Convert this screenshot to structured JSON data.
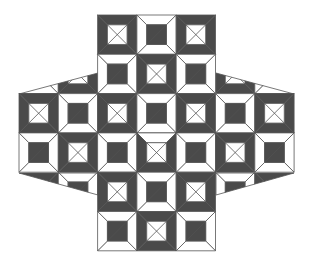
{
  "figure": {
    "width": 311,
    "height": 269,
    "origin_x": 19,
    "origin_y": 15,
    "tile_size": 39.3,
    "inner_ratio": 0.5,
    "colors": {
      "background": "#ffffff",
      "dark": "#4a4a4a",
      "light": "#ffffff",
      "line": "#555555"
    },
    "tile_types": {
      "A": "dark frame, white inner square with X",
      "B": "white frame, dark inner square",
      "X": "hybrid: light top bevel, dark side/bottom bevels, white inner square with X"
    },
    "tiles": [
      {
        "row": 0,
        "col": 2,
        "type": "A"
      },
      {
        "row": 0,
        "col": 3,
        "type": "B"
      },
      {
        "row": 0,
        "col": 4,
        "type": "A"
      },
      {
        "row": 1,
        "col": 2,
        "type": "B"
      },
      {
        "row": 1,
        "col": 3,
        "type": "A"
      },
      {
        "row": 1,
        "col": 4,
        "type": "B"
      },
      {
        "row": 2,
        "col": 0,
        "type": "A"
      },
      {
        "row": 2,
        "col": 1,
        "type": "B"
      },
      {
        "row": 2,
        "col": 2,
        "type": "A"
      },
      {
        "row": 2,
        "col": 3,
        "type": "B"
      },
      {
        "row": 2,
        "col": 4,
        "type": "A"
      },
      {
        "row": 2,
        "col": 5,
        "type": "B"
      },
      {
        "row": 2,
        "col": 6,
        "type": "A"
      },
      {
        "row": 3,
        "col": 0,
        "type": "B"
      },
      {
        "row": 3,
        "col": 1,
        "type": "A"
      },
      {
        "row": 3,
        "col": 2,
        "type": "B"
      },
      {
        "row": 3,
        "col": 3,
        "type": "X"
      },
      {
        "row": 3,
        "col": 4,
        "type": "B"
      },
      {
        "row": 3,
        "col": 5,
        "type": "A"
      },
      {
        "row": 3,
        "col": 6,
        "type": "B"
      },
      {
        "row": 4,
        "col": 2,
        "type": "A"
      },
      {
        "row": 4,
        "col": 3,
        "type": "B"
      },
      {
        "row": 4,
        "col": 4,
        "type": "A"
      },
      {
        "row": 5,
        "col": 2,
        "type": "B"
      },
      {
        "row": 5,
        "col": 3,
        "type": "A"
      },
      {
        "row": 5,
        "col": 4,
        "type": "B"
      }
    ],
    "flaps": [
      {
        "name": "top-left-flap",
        "tiles": [
          {
            "row": 1,
            "col": 0,
            "type": "B"
          },
          {
            "row": 1,
            "col": 1,
            "type": "A"
          }
        ],
        "clip": [
          [
            19,
            94
          ],
          [
            98,
            73
          ],
          [
            98,
            94
          ]
        ]
      },
      {
        "name": "top-right-flap",
        "tiles": [
          {
            "row": 1,
            "col": 5,
            "type": "A"
          },
          {
            "row": 1,
            "col": 6,
            "type": "B"
          }
        ],
        "clip": [
          [
            216,
            73
          ],
          [
            294,
            94
          ],
          [
            216,
            94
          ]
        ]
      },
      {
        "name": "bottom-left-flap",
        "tiles": [
          {
            "row": 4,
            "col": 0,
            "type": "A"
          },
          {
            "row": 4,
            "col": 1,
            "type": "B"
          }
        ],
        "clip": [
          [
            19,
            173
          ],
          [
            98,
            173
          ],
          [
            98,
            195
          ]
        ]
      },
      {
        "name": "bottom-right-flap",
        "tiles": [
          {
            "row": 4,
            "col": 5,
            "type": "B"
          },
          {
            "row": 4,
            "col": 6,
            "type": "A"
          }
        ],
        "clip": [
          [
            216,
            173
          ],
          [
            294,
            173
          ],
          [
            216,
            195
          ]
        ]
      }
    ]
  }
}
